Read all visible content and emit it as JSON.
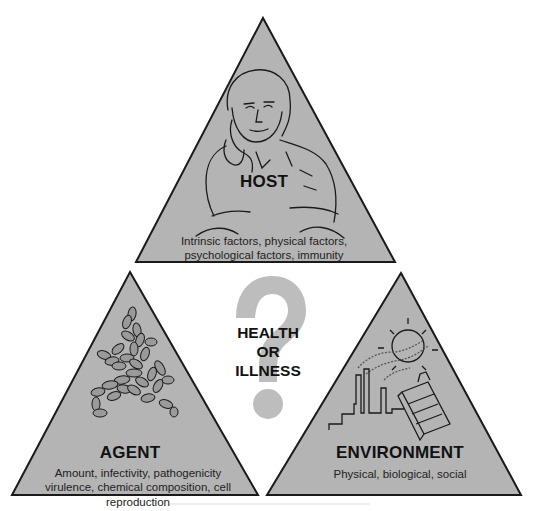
{
  "diagram": {
    "type": "epidemiologic-triangle",
    "colors": {
      "triangle_fill": "#b4b4b4",
      "triangle_stroke": "#1a1a1a",
      "question_mark": "#bdbdbd",
      "text": "#111111",
      "background": "#ffffff"
    },
    "host": {
      "title": "HOST",
      "description_line1": "Intrinsic factors, physical factors,",
      "description_line2": "psychological factors, immunity",
      "illustration": "woman-resting-chin-on-hand"
    },
    "agent": {
      "title": "AGENT",
      "description_line1": "Amount, infectivity, pathogenicity",
      "description_line2": "virulence, chemical composition, cell reproduction",
      "illustration": "bacteria-cluster"
    },
    "environment": {
      "title": "ENVIRONMENT",
      "description_line1": "Physical, biological, social",
      "illustration": "factory-smokestacks-sun-cigarette-pack"
    },
    "center": {
      "line1": "HEALTH",
      "line2": "OR",
      "line3": "ILLNESS",
      "icon": "question-mark-icon"
    }
  }
}
